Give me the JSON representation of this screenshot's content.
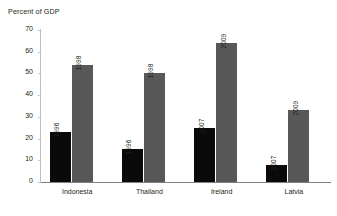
{
  "chart_data": {
    "type": "bar",
    "title": "Percent of GDP",
    "xlabel": "",
    "ylabel": "",
    "ylim": [
      0,
      70
    ],
    "ytick_step": 10,
    "yticks": [
      70,
      60,
      50,
      40,
      30,
      20,
      10,
      0
    ],
    "ytick_labels": [
      "70",
      "60",
      "50",
      "40",
      "30",
      "20",
      "10",
      "0"
    ],
    "grid": false,
    "legend": "none",
    "categories": [
      "Indonesia",
      "Thailand",
      "Ireland",
      "Latvia"
    ],
    "series": [
      {
        "name": "first-period",
        "color": "#0a0a0a",
        "values": [
          23,
          15,
          25,
          8
        ],
        "point_labels": [
          "1996",
          "1996",
          "2007",
          "2007"
        ]
      },
      {
        "name": "second-period",
        "color": "#585858",
        "values": [
          54,
          50,
          64,
          33
        ],
        "point_labels": [
          "1998",
          "1998",
          "2009",
          "2009"
        ]
      }
    ],
    "axis_color": "#808080",
    "text_color": "#231f20",
    "background": "#ffffff"
  }
}
